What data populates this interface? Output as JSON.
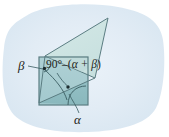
{
  "figure": {
    "kind": "geometry-diagram",
    "width": 169,
    "height": 137,
    "labels": {
      "beta": "β",
      "alpha": "α",
      "complement_prefix": "90°–(",
      "complement_body": "α + β",
      "complement_suffix": ")",
      "complement_full": "90°–(α + β)"
    },
    "colors": {
      "page_background": "#ffffff",
      "blob_background": "#dfeaf4",
      "blob_background_inner": "#e7f0f7",
      "square_fill": "#a9cdd1",
      "square_dark_fill": "#8fbcc1",
      "flap_fill": "#cfe5e4",
      "flap_fill_light": "#d9eceb",
      "outline": "#4c6e73",
      "leader_line": "#4c6e73",
      "label_text": "#231f20",
      "marker_dot": "#1c2b2e"
    },
    "geometry": {
      "square": {
        "left": 39,
        "top": 57,
        "right": 88,
        "bottom": 105
      },
      "flap_apex": {
        "x": 108,
        "y": 18
      },
      "flap_upper_left": {
        "x": 45,
        "y": 56
      },
      "flap_lower_right": {
        "x": 95,
        "y": 78
      },
      "diagonal_start": {
        "x": 39,
        "y": 103
      },
      "diagonal_end": {
        "x": 95,
        "y": 78
      },
      "beta_vertex": {
        "x": 44,
        "y": 68
      },
      "mid_marker": {
        "x": 68,
        "y": 87
      },
      "alpha_vertex": {
        "x": 88,
        "y": 105
      }
    }
  }
}
